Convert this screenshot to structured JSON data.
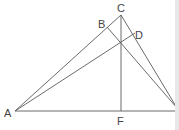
{
  "diagram": {
    "type": "geometry-triangle-altitudes",
    "points": {
      "A": {
        "label": "A",
        "x": 15,
        "y": 111
      },
      "B": {
        "label": "B",
        "x": 107,
        "y": 27
      },
      "C": {
        "label": "C",
        "x": 121,
        "y": 15
      },
      "D": {
        "label": "D",
        "x": 135,
        "y": 33
      },
      "F": {
        "label": "F",
        "x": 121,
        "y": 111
      },
      "E": {
        "x": 177,
        "y": 108
      }
    },
    "segments": [
      [
        "A",
        "C"
      ],
      [
        "C",
        "E"
      ],
      [
        "A",
        "E"
      ],
      [
        "A",
        "D"
      ],
      [
        "E",
        "B"
      ],
      [
        "C",
        "F"
      ]
    ],
    "labels": {
      "A": "A",
      "B": "B",
      "C": "C",
      "D": "D",
      "F": "F"
    },
    "line_color": "#5a5a5a",
    "text_color": "#444444"
  }
}
